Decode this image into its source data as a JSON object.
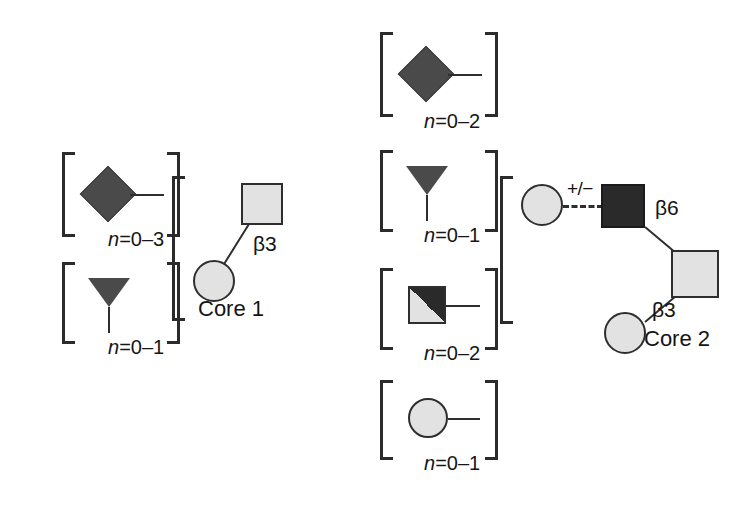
{
  "figure": {
    "type": "glycan-structure-diagram",
    "background_color": "#ffffff",
    "symbol_colors": {
      "light_gray_fill": "#e2e2e2",
      "dark_gray_fill": "#4a4a4a",
      "black_fill": "#2a2a2a",
      "outline": "#2e2e2e"
    }
  },
  "core1": {
    "name": "core-1",
    "label": "Core 1",
    "linkage_label": "β3",
    "symbols": [
      {
        "id": "core1-galnac-square",
        "shape": "square",
        "fill": "light_gray",
        "role": "reducing-end-GalNAc"
      },
      {
        "id": "core1-gal-circle",
        "shape": "circle",
        "fill": "light_gray",
        "role": "Gal"
      }
    ],
    "bracket": "left-only",
    "substituents": [
      {
        "id": "core1-sub-diamond",
        "shape": "diamond",
        "fill": "dark_gray",
        "bracket": "both",
        "count_label_prefix": "n",
        "count_label_value": "=0–3",
        "count_label_full": "n=0–3",
        "stub": "horizontal-right"
      },
      {
        "id": "core1-sub-triangle",
        "shape": "triangle-down",
        "fill": "dark_gray",
        "bracket": "both",
        "count_label_prefix": "n",
        "count_label_value": "=0–1",
        "count_label_full": "n=0–1",
        "stub": "vertical-down"
      }
    ]
  },
  "core2": {
    "name": "core-2",
    "label": "Core 2",
    "linkage_label_upper": "β6",
    "linkage_label_lower": "β3",
    "optional_marker": "+/−",
    "optional_bond_style": "dashed",
    "bracket": "left-only",
    "symbols": [
      {
        "id": "core2-galnac-square",
        "shape": "square",
        "fill": "light_gray",
        "role": "reducing-end-GalNAc"
      },
      {
        "id": "core2-glcnac-square",
        "shape": "square",
        "fill": "black",
        "role": "GlcNAc-branch"
      },
      {
        "id": "core2-gal-circle-upper",
        "shape": "circle",
        "fill": "light_gray",
        "role": "Gal-optional"
      },
      {
        "id": "core2-gal-circle-lower",
        "shape": "circle",
        "fill": "light_gray",
        "role": "Gal"
      }
    ],
    "substituents": [
      {
        "id": "core2-sub-diamond",
        "shape": "diamond",
        "fill": "dark_gray",
        "bracket": "both",
        "count_label_prefix": "n",
        "count_label_value": "=0–2",
        "count_label_full": "n=0–2",
        "stub": "horizontal-right"
      },
      {
        "id": "core2-sub-triangle",
        "shape": "triangle-down",
        "fill": "dark_gray",
        "bracket": "both",
        "count_label_prefix": "n",
        "count_label_value": "=0–1",
        "count_label_full": "n=0–1",
        "stub": "vertical-down"
      },
      {
        "id": "core2-sub-split-square",
        "shape": "square-split-diagonal",
        "fill": "light_gray-and-black",
        "bracket": "both",
        "count_label_prefix": "n",
        "count_label_value": "=0–2",
        "count_label_full": "n=0–2",
        "stub": "horizontal-right"
      },
      {
        "id": "core2-sub-circle",
        "shape": "circle",
        "fill": "light_gray",
        "bracket": "both",
        "count_label_prefix": "n",
        "count_label_value": "=0–1",
        "count_label_full": "n=0–1",
        "stub": "horizontal-right"
      }
    ]
  }
}
